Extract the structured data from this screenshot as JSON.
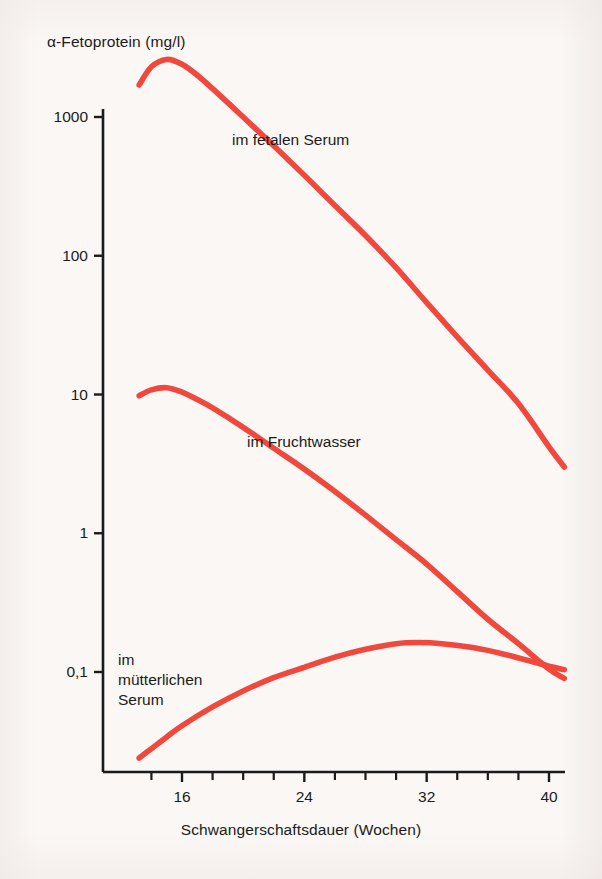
{
  "chart_data": {
    "type": "line",
    "title": "α-Fetoprotein (mg/l)",
    "xlabel": "Schwangerschaftsdauer (Wochen)",
    "ylabel": "α-Fetoprotein (mg/l)",
    "yscale": "log",
    "ylim": [
      0.02,
      3000
    ],
    "xlim": [
      13,
      41
    ],
    "grid": false,
    "legend_position": "inline-labels",
    "line_color": "#f0483c",
    "axis_color": "#1b1b1b",
    "background_color": "#faf7f5",
    "y_tick_labels": [
      "1000",
      "100",
      "10",
      "1",
      "0,1"
    ],
    "y_tick_values": [
      1000,
      100,
      10,
      1,
      0.1
    ],
    "x_tick_labels": [
      "16",
      "24",
      "32",
      "40"
    ],
    "x_tick_values": [
      16,
      24,
      32,
      40
    ],
    "x_minor_ticks": [
      14,
      18,
      20,
      22,
      26,
      28,
      30,
      34,
      36,
      38
    ],
    "series": [
      {
        "name": "im fetalen Serum",
        "label": "im fetalen Serum",
        "x": [
          13.2,
          14.0,
          15.0,
          16.0,
          17.0,
          18.0,
          20.0,
          22.0,
          24.0,
          26.0,
          28.0,
          30.0,
          32.0,
          34.0,
          36.0,
          38.0,
          40.0,
          41.0
        ],
        "values": [
          1700,
          2300,
          2600,
          2400,
          2000,
          1600,
          1000,
          620,
          380,
          230,
          140,
          82,
          46,
          26,
          15,
          8.6,
          4.2,
          3.0
        ]
      },
      {
        "name": "im Fruchtwasser",
        "label": "im Fruchtwasser",
        "x": [
          13.2,
          14.0,
          15.0,
          16.0,
          17.0,
          18.0,
          20.0,
          22.0,
          24.0,
          26.0,
          28.0,
          30.0,
          32.0,
          34.0,
          36.0,
          38.0,
          40.0,
          41.0
        ],
        "values": [
          9.8,
          10.8,
          11.2,
          10.4,
          9.2,
          8.0,
          5.8,
          4.1,
          2.9,
          2.0,
          1.35,
          0.9,
          0.6,
          0.38,
          0.24,
          0.16,
          0.105,
          0.09
        ]
      },
      {
        "name": "im mütterlichen Serum",
        "label": "im\nmütterlichen\nSerum",
        "x": [
          13.2,
          14.0,
          15.0,
          16.0,
          18.0,
          20.0,
          22.0,
          24.0,
          26.0,
          28.0,
          30.0,
          31.5,
          33.0,
          35.0,
          37.0,
          39.0,
          40.0,
          41.0
        ],
        "values": [
          0.024,
          0.028,
          0.034,
          0.041,
          0.056,
          0.073,
          0.091,
          0.108,
          0.128,
          0.146,
          0.16,
          0.163,
          0.16,
          0.15,
          0.135,
          0.118,
          0.11,
          0.104
        ]
      }
    ]
  },
  "figure": {
    "title": "α-Fetoprotein (mg/l)",
    "xaxis_title": "Schwangerschaftsdauer (Wochen)"
  }
}
